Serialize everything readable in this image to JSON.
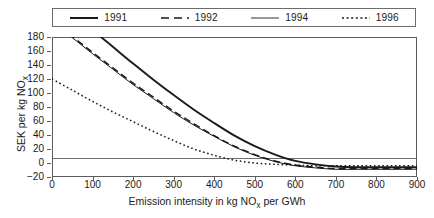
{
  "figure": {
    "background": "#ffffff",
    "axis_color": "#5c5c5c",
    "text_color": "#1a1a1a"
  },
  "legend": {
    "position": "top-outside",
    "entries": [
      {
        "label": "1991",
        "style": "solid-thick",
        "color": "#1a1a1a",
        "width": 1.9,
        "dash": "none"
      },
      {
        "label": "1992",
        "style": "dashed",
        "color": "#1a1a1a",
        "width": 1.5,
        "dash": "7,4"
      },
      {
        "label": "1994",
        "style": "solid-thin",
        "color": "#1a1a1a",
        "width": 1.0,
        "dash": "none"
      },
      {
        "label": "1996",
        "style": "dotted",
        "color": "#1a1a1a",
        "width": 1.5,
        "dash": "1.6,2.6"
      }
    ]
  },
  "axes": {
    "x": {
      "title_parts": {
        "pre": "Emission intensity in kg NO",
        "sub": "x",
        "post": " per GWh"
      },
      "title_plain": "Emission intensity in kg NOx per GWh",
      "min": 0,
      "max": 900,
      "step": 100,
      "ticks": [
        0,
        100,
        200,
        300,
        400,
        500,
        600,
        700,
        800,
        900
      ]
    },
    "y": {
      "title_parts": {
        "pre": "SEK per kg NO",
        "sub": "x",
        "post": ""
      },
      "title_plain": "SEK per kg NOx",
      "min": -20,
      "max": 180,
      "step": 20,
      "ticks": [
        180,
        160,
        140,
        120,
        100,
        80,
        60,
        40,
        20,
        0,
        -20
      ]
    },
    "grid": false,
    "zero_reference_line": true
  },
  "chart_data": {
    "type": "line",
    "title": "",
    "subtitle": "",
    "xlabel": "Emission intensity in kg NOx per GWh",
    "ylabel": "SEK per kg NOx",
    "xlim": [
      0,
      900
    ],
    "ylim": [
      -20,
      180
    ],
    "grid": false,
    "legend_position": "top-outside",
    "x": [
      0,
      50,
      100,
      150,
      200,
      250,
      300,
      350,
      400,
      450,
      500,
      550,
      600,
      650,
      700,
      750,
      800,
      850,
      900
    ],
    "series": [
      {
        "name": "1991",
        "style": "solid-thick",
        "values": [
          240,
          215,
          190,
          166,
          142,
          119,
          97,
          76,
          57,
          39,
          24,
          12,
          3,
          -2,
          -5,
          -6,
          -6,
          -6,
          -6
        ]
      },
      {
        "name": "1992",
        "style": "dashed",
        "values": [
          205,
          181,
          158,
          136,
          114,
          94,
          74,
          56,
          39,
          24,
          12,
          3,
          -3,
          -6,
          -8,
          -8,
          -8,
          -8,
          -8
        ]
      },
      {
        "name": "1994",
        "style": "solid-thin",
        "values": [
          203,
          179,
          156,
          134,
          112,
          92,
          72,
          54,
          38,
          23,
          11,
          2,
          -4,
          -7,
          -9,
          -9,
          -9,
          -9,
          -9
        ]
      },
      {
        "name": "1996",
        "style": "dotted",
        "values": [
          120,
          104,
          88,
          73,
          59,
          45,
          32,
          20,
          11,
          4,
          0,
          -2,
          -3,
          -4,
          -4,
          -4,
          -4,
          -4,
          -4
        ]
      }
    ]
  }
}
